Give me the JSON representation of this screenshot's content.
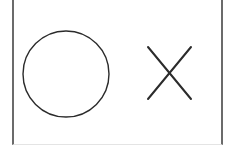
{
  "board": {
    "description": "tic-tac-toe style cell row",
    "cells": [
      {
        "mark": "O",
        "icon": "circle-icon",
        "stroke": "#2b2b2b"
      },
      {
        "mark": "X",
        "icon": "cross-icon",
        "stroke": "#2b2b2b"
      }
    ],
    "colors": {
      "border": "#6b6b6b",
      "background": "#ffffff"
    }
  }
}
